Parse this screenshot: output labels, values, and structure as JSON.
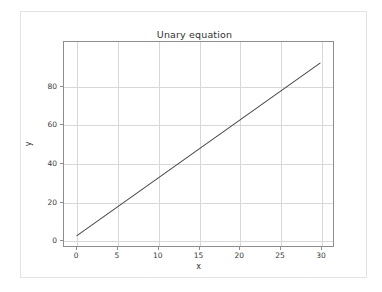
{
  "chart_data": {
    "type": "line",
    "title": "Unary equation",
    "xlabel": "x",
    "ylabel": "y",
    "xlim": [
      -1.6,
      31.6
    ],
    "ylim": [
      -3.4,
      103.0
    ],
    "xticks": [
      0,
      5,
      10,
      15,
      20,
      25,
      30
    ],
    "xtick_labels": [
      "0",
      "5",
      "10",
      "15",
      "20",
      "25",
      "30"
    ],
    "yticks": [
      0,
      20,
      40,
      60,
      80
    ],
    "ytick_labels": [
      "0",
      "20",
      "40",
      "60",
      "80"
    ],
    "grid": true,
    "legend": null,
    "series": [
      {
        "name": "y = 3x + 2",
        "color": "#4a4a4a",
        "x": [
          0,
          5,
          10,
          15,
          20,
          25,
          30
        ],
        "values": [
          2,
          17,
          32,
          47,
          62,
          77,
          92
        ]
      }
    ]
  },
  "figure": {
    "background": "#ffffff",
    "border_color": "#e3e3e3",
    "axes_color": "#8d8d8d",
    "grid_color": "#d8d8d8",
    "line_color": "#4a4a4a"
  }
}
